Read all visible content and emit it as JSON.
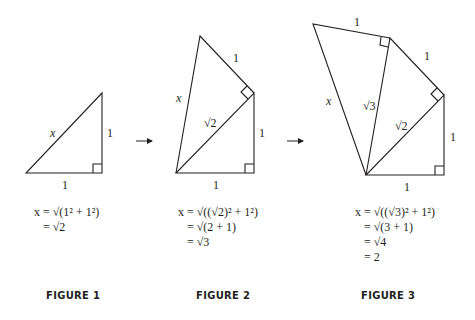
{
  "colors": {
    "stroke": "#231f20",
    "background": "#ffffff"
  },
  "figures": [
    {
      "caption": "FIGURE 1",
      "labels": {
        "hyp": "x",
        "vert": "1",
        "base": "1"
      },
      "equation": [
        "x = √(1² + 1²)",
        "= √2"
      ]
    },
    {
      "caption": "FIGURE 2",
      "labels": {
        "hyp": "x",
        "top": "1",
        "diag": "√2",
        "vert": "1",
        "base": "1"
      },
      "equation": [
        "x = √((√2)² + 1²)",
        "= √(2 + 1)",
        "= √3"
      ]
    },
    {
      "caption": "FIGURE 3",
      "labels": {
        "hyp": "x",
        "top": "1",
        "upper": "1",
        "diag3": "√3",
        "diag2": "√2",
        "vert": "1",
        "base": "1"
      },
      "equation": [
        "x = √((√3)² + 1²)",
        "= √(3 + 1)",
        "= √4",
        "= 2"
      ]
    }
  ],
  "arrows": [
    "arrow-1-to-2",
    "arrow-2-to-3"
  ]
}
